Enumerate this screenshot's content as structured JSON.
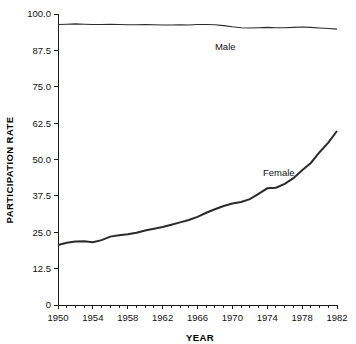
{
  "chart_data": {
    "type": "line",
    "title": "",
    "xlabel": "YEAR",
    "ylabel": "PARTICIPATION RATE",
    "xlim": [
      1950,
      1982
    ],
    "ylim": [
      0,
      100
    ],
    "grid": false,
    "legend_position": "inline-annotation",
    "xticks": [
      1950,
      1954,
      1958,
      1962,
      1966,
      1970,
      1974,
      1978,
      1982
    ],
    "xtick_labels": [
      "1950",
      "1954",
      "1958",
      "1962",
      "1966",
      "1970",
      "1974",
      "1978",
      "1982"
    ],
    "xminor_interval": 1,
    "yticks": [
      0,
      12.5,
      25.0,
      37.5,
      50.0,
      62.5,
      75.0,
      87.5,
      100.0
    ],
    "ytick_labels": [
      "0",
      "12.5",
      "25.0",
      "37.5",
      "50.0",
      "62.5",
      "75.0",
      "87.5",
      "100.0"
    ],
    "x": [
      1950,
      1951,
      1952,
      1953,
      1954,
      1955,
      1956,
      1957,
      1958,
      1959,
      1960,
      1961,
      1962,
      1963,
      1964,
      1965,
      1966,
      1967,
      1968,
      1969,
      1970,
      1971,
      1972,
      1973,
      1974,
      1975,
      1976,
      1977,
      1978,
      1979,
      1980,
      1981,
      1982
    ],
    "series": [
      {
        "name": "Male",
        "label": "Male",
        "color": "#2b2b2b",
        "values": [
          96.4,
          96.5,
          96.6,
          96.5,
          96.4,
          96.4,
          96.5,
          96.4,
          96.3,
          96.3,
          96.4,
          96.3,
          96.2,
          96.2,
          96.3,
          96.2,
          96.4,
          96.4,
          96.3,
          96.3,
          96.1,
          95.8,
          95.7,
          95.7,
          95.7,
          95.5,
          95.5,
          95.5,
          95.6,
          95.5,
          95.3,
          95.1,
          94.9
        ],
        "annotation": {
          "text": "Male",
          "x": 1968.0,
          "y": 87.5
        }
      },
      {
        "name": "Female",
        "label": "Female",
        "color": "#2b2b2b",
        "values": [
          20.6,
          21.4,
          21.7,
          21.8,
          21.7,
          22.5,
          23.3,
          23.5,
          23.7,
          24.0,
          24.8,
          25.4,
          25.6,
          26.2,
          26.9,
          27.6,
          28.8,
          30.0,
          30.9,
          31.8,
          32.4,
          32.6,
          33.1,
          34.2,
          35.5,
          35.5,
          36.4,
          37.6,
          38.8,
          40.0,
          41.0,
          41.8,
          42.3
        ],
        "annotation": {
          "text": "Female",
          "x": 1973.5,
          "y": 44.5
        }
      }
    ]
  },
  "chart_display": {
    "female_scaled_values": [
      20.6,
      21.4,
      21.8,
      21.9,
      21.6,
      22.3,
      23.5,
      24.0,
      24.3,
      24.8,
      25.6,
      26.2,
      26.8,
      27.6,
      28.4,
      29.2,
      30.3,
      31.7,
      32.9,
      34.0,
      34.9,
      35.4,
      36.4,
      38.2,
      40.1,
      40.3,
      41.6,
      43.6,
      46.3,
      48.8,
      52.5,
      55.8,
      59.8
    ],
    "male_scaled_values": [
      96.4,
      96.5,
      96.6,
      96.5,
      96.4,
      96.4,
      96.5,
      96.4,
      96.3,
      96.3,
      96.4,
      96.3,
      96.2,
      96.2,
      96.3,
      96.2,
      96.4,
      96.4,
      96.3,
      96.0,
      95.6,
      95.3,
      95.2,
      95.3,
      95.4,
      95.3,
      95.3,
      95.4,
      95.5,
      95.4,
      95.2,
      95.0,
      94.8
    ]
  },
  "labels": {
    "male": "Male",
    "female": "Female",
    "x_axis_title": "YEAR",
    "y_axis_title": "PARTICIPATION RATE"
  }
}
